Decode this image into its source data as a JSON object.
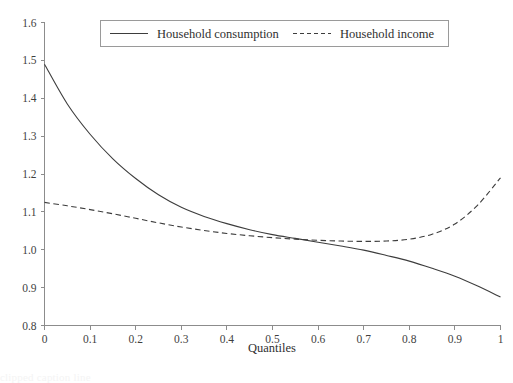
{
  "figure": {
    "background_color": "#ffffff",
    "axis_color": "#8c8c8c",
    "line_color": "#3d3d3d",
    "text_color": "#2f2f2f"
  },
  "axes": {
    "xlabel": "Quantiles",
    "ylabel": "",
    "x_ticks": [
      "0",
      "0.1",
      "0.2",
      "0.3",
      "0.4",
      "0.5",
      "0.6",
      "0.7",
      "0.8",
      "0.9",
      "1"
    ],
    "y_ticks": [
      "0.8",
      "0.9",
      "1.0",
      "1.1",
      "1.2",
      "1.3",
      "1.4",
      "1.5",
      "1.6"
    ]
  },
  "legend": {
    "position": "top-center",
    "entries": [
      {
        "label": "Household consumption",
        "style": "solid"
      },
      {
        "label": "Household income",
        "style": "dashed"
      }
    ]
  },
  "caption": {
    "clipped_text": "clipped caption line"
  },
  "chart_data": {
    "type": "line",
    "title": "",
    "xlabel": "Quantiles",
    "ylabel": "",
    "xlim": [
      0,
      1
    ],
    "ylim": [
      0.8,
      1.6
    ],
    "grid": false,
    "legend_position": "top-center",
    "x": [
      0,
      0.05,
      0.1,
      0.15,
      0.2,
      0.25,
      0.3,
      0.35,
      0.4,
      0.45,
      0.5,
      0.55,
      0.6,
      0.65,
      0.7,
      0.75,
      0.8,
      0.85,
      0.9,
      0.95,
      1
    ],
    "series": [
      {
        "name": "Household consumption",
        "style": "solid",
        "values": [
          1.49,
          1.385,
          1.305,
          1.24,
          1.188,
          1.145,
          1.112,
          1.088,
          1.069,
          1.053,
          1.04,
          1.03,
          1.02,
          1.01,
          0.999,
          0.985,
          0.97,
          0.951,
          0.93,
          0.904,
          0.875
        ]
      },
      {
        "name": "Household income",
        "style": "dashed",
        "values": [
          1.125,
          1.116,
          1.106,
          1.095,
          1.083,
          1.071,
          1.06,
          1.051,
          1.043,
          1.037,
          1.032,
          1.028,
          1.025,
          1.023,
          1.022,
          1.023,
          1.028,
          1.041,
          1.068,
          1.118,
          1.19
        ]
      }
    ],
    "annotations": []
  }
}
